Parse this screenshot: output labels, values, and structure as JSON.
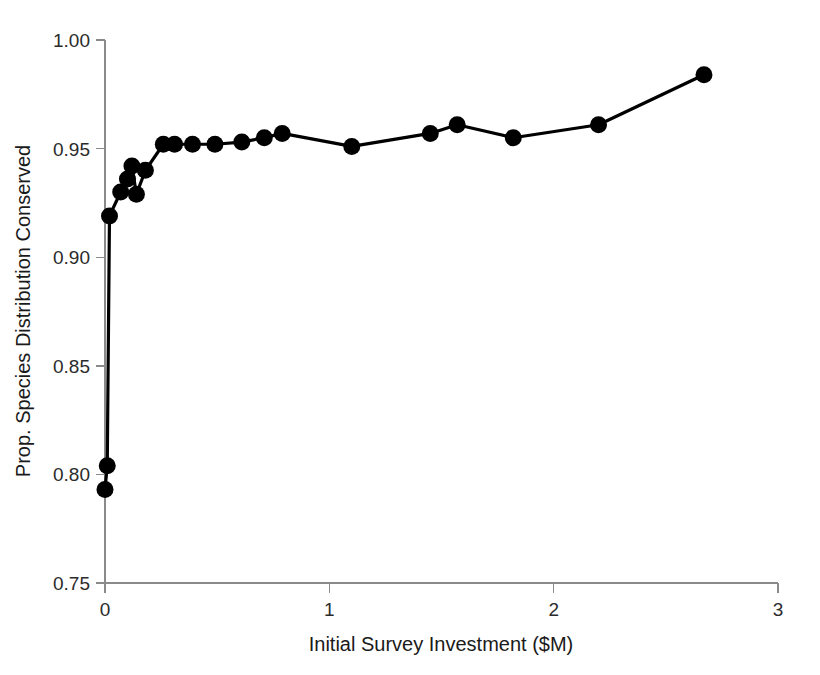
{
  "chart_data": {
    "type": "line",
    "title": "",
    "subtitle": "",
    "xlabel": "Initial Survey Investment ($M)",
    "ylabel": "Prop. Species Distribution Conserved",
    "xlim": [
      0,
      3
    ],
    "ylim": [
      0.75,
      1.0
    ],
    "xticks": [
      0,
      1,
      2,
      3
    ],
    "xtick_labels": [
      "0",
      "1",
      "2",
      "3"
    ],
    "yticks": [
      0.75,
      0.8,
      0.85,
      0.9,
      0.95,
      1.0
    ],
    "ytick_labels": [
      "0.75",
      "0.80",
      "0.85",
      "0.90",
      "0.95",
      "1.00"
    ],
    "grid": false,
    "legend": false,
    "legend_position": "none",
    "marker": "circle-filled",
    "marker_color": "#000000",
    "line_color": "#000000",
    "background_color": "#ffffff",
    "axis_color": "#8a8a8a",
    "series": [
      {
        "name": "Prop. Species Distribution Conserved",
        "x": [
          0.0,
          0.01,
          0.02,
          0.07,
          0.1,
          0.12,
          0.14,
          0.18,
          0.26,
          0.31,
          0.39,
          0.49,
          0.61,
          0.71,
          0.79,
          1.1,
          1.45,
          1.57,
          1.82,
          2.2,
          2.67
        ],
        "y": [
          0.793,
          0.804,
          0.919,
          0.93,
          0.936,
          0.942,
          0.929,
          0.94,
          0.952,
          0.952,
          0.952,
          0.952,
          0.953,
          0.955,
          0.957,
          0.951,
          0.957,
          0.961,
          0.955,
          0.961,
          0.984
        ]
      }
    ]
  },
  "axes": {
    "x_title": "Initial Survey Investment ($M)",
    "y_title": "Prop. Species Distribution Conserved"
  }
}
